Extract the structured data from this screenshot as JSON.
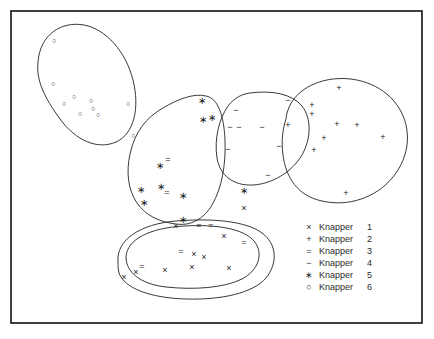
{
  "figure": {
    "type": "scatter-cluster-plot",
    "background_color": "#ffffff",
    "border_color": "#111111",
    "marker_color": "#1a1a1a",
    "hull_color": "#232323",
    "frame": {
      "x": 11,
      "y": 11,
      "width": 411,
      "height": 312
    }
  },
  "legend": {
    "x": 305,
    "y": 228,
    "row_height": 12,
    "items": [
      {
        "marker": "x",
        "glyph": "×",
        "label": "Knapper",
        "number": "1",
        "icon_name": "cross-marker-icon"
      },
      {
        "marker": "plus",
        "glyph": "+",
        "label": "Knapper",
        "number": "2",
        "icon_name": "plus-marker-icon"
      },
      {
        "marker": "equals",
        "glyph": "=",
        "label": "Knapper",
        "number": "3",
        "icon_name": "equals-marker-icon"
      },
      {
        "marker": "minus",
        "glyph": "−",
        "label": "Knapper",
        "number": "4",
        "icon_name": "minus-marker-icon"
      },
      {
        "marker": "star",
        "glyph": "∗",
        "label": "Knapper",
        "number": "5",
        "icon_name": "asterisk-marker-icon"
      },
      {
        "marker": "circle",
        "glyph": "○",
        "label": "Knapper",
        "number": "6",
        "icon_name": "circle-marker-icon"
      }
    ]
  },
  "chart_data": {
    "type": "scatter",
    "title": "",
    "xlabel": "",
    "ylabel": "",
    "grid": false,
    "axis_ticks": false,
    "legend_position": "bottom-right",
    "xlim": [
      11,
      422
    ],
    "ylim": [
      11,
      323
    ],
    "note": "Pixel coordinates of plotted symbols; y increases downward as in the image.",
    "series": [
      {
        "name": "Knapper 1",
        "marker": "x",
        "glyph": "×",
        "size": 9,
        "points": [
          [
            176,
            226
          ],
          [
            244,
            208
          ],
          [
            224,
            236
          ],
          [
            194,
            254
          ],
          [
            204,
            257
          ],
          [
            192,
            267
          ],
          [
            165,
            270
          ],
          [
            136,
            272
          ],
          [
            229,
            268
          ],
          [
            124,
            277
          ]
        ]
      },
      {
        "name": "Knapper 2",
        "marker": "plus",
        "glyph": "+",
        "size": 9,
        "points": [
          [
            339,
            88
          ],
          [
            312,
            105
          ],
          [
            312,
            114
          ],
          [
            288,
            125
          ],
          [
            337,
            124
          ],
          [
            357,
            125
          ],
          [
            324,
            138
          ],
          [
            314,
            150
          ],
          [
            383,
            137
          ],
          [
            346,
            193
          ]
        ]
      },
      {
        "name": "Knapper 3",
        "marker": "equals",
        "glyph": "=",
        "size": 9,
        "points": [
          [
            168,
            159
          ],
          [
            167,
            192
          ],
          [
            181,
            251
          ],
          [
            142,
            266
          ],
          [
            199,
            225
          ],
          [
            211,
            225
          ],
          [
            244,
            242
          ]
        ]
      },
      {
        "name": "Knapper 4",
        "marker": "minus",
        "glyph": "−",
        "size": 9,
        "points": [
          [
            236,
            110
          ],
          [
            230,
            127
          ],
          [
            239,
            127
          ],
          [
            262,
            127
          ],
          [
            288,
            100
          ],
          [
            279,
            146
          ],
          [
            228,
            149
          ],
          [
            268,
            175
          ]
        ]
      },
      {
        "name": "Knapper 5",
        "marker": "star",
        "glyph": "∗",
        "size": 10,
        "points": [
          [
            202,
            100
          ],
          [
            203,
            119
          ],
          [
            212,
            117
          ],
          [
            160,
            165
          ],
          [
            161,
            186
          ],
          [
            141,
            189
          ],
          [
            144,
            202
          ],
          [
            183,
            195
          ],
          [
            183,
            219
          ],
          [
            244,
            190
          ]
        ]
      },
      {
        "name": "Knapper 6",
        "marker": "circle",
        "glyph": "○",
        "size": 7,
        "points": [
          [
            54,
            40
          ],
          [
            53,
            83
          ],
          [
            64,
            103
          ],
          [
            74,
            96
          ],
          [
            91,
            100
          ],
          [
            93,
            108
          ],
          [
            80,
            113
          ],
          [
            98,
            114
          ],
          [
            128,
            103
          ],
          [
            133,
            135
          ]
        ]
      }
    ],
    "clusters": [
      {
        "name": "cluster-knapper-6",
        "shape": "ellipse"
      },
      {
        "name": "cluster-knapper-5",
        "shape": "blob"
      },
      {
        "name": "cluster-knapper-4",
        "shape": "blob"
      },
      {
        "name": "cluster-knapper-2",
        "shape": "blob"
      },
      {
        "name": "cluster-knapper-1-outer",
        "shape": "ellipse"
      },
      {
        "name": "cluster-knapper-1-inner",
        "shape": "ellipse"
      }
    ]
  }
}
